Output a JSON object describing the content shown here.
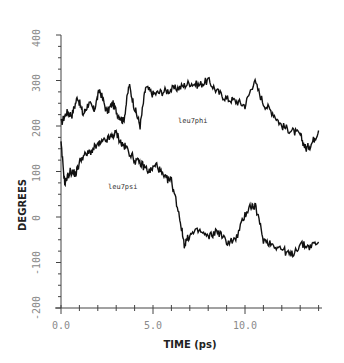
{
  "chart_data": {
    "type": "line",
    "title": "",
    "xlabel": "TIME (ps)",
    "ylabel": "DEGREES",
    "xlim": [
      0,
      14
    ],
    "ylim": [
      -200,
      400
    ],
    "grid": false,
    "legend": "inline labels",
    "x_ticks": [
      "0.0",
      "5.0",
      "10.0"
    ],
    "y_ticks": [
      "-200",
      "-100",
      "0",
      "100",
      "200",
      "300",
      "400"
    ],
    "series": [
      {
        "name": "leu7phi",
        "label": "leu7phi",
        "x": [
          0,
          0.3,
          0.6,
          0.9,
          1.2,
          1.5,
          1.8,
          2.1,
          2.5,
          2.8,
          3.1,
          3.4,
          3.7,
          4.0,
          4.3,
          4.6,
          5.0,
          5.5,
          6.0,
          6.5,
          7.0,
          7.5,
          8.0,
          8.5,
          9.0,
          9.5,
          10.0,
          10.5,
          11.0,
          11.5,
          12.0,
          12.5,
          13.0,
          13.3,
          13.6,
          14.0
        ],
        "values": [
          205,
          230,
          225,
          265,
          225,
          250,
          235,
          280,
          230,
          250,
          225,
          210,
          290,
          240,
          200,
          285,
          270,
          275,
          280,
          285,
          295,
          290,
          300,
          275,
          260,
          255,
          245,
          300,
          250,
          230,
          200,
          190,
          180,
          150,
          160,
          190
        ]
      },
      {
        "name": "leu7psi",
        "label": "leu7psi",
        "x": [
          0,
          0.2,
          0.5,
          0.8,
          1.1,
          1.5,
          1.9,
          2.3,
          2.7,
          3.0,
          3.3,
          3.6,
          4.0,
          4.4,
          4.8,
          5.2,
          5.6,
          6.0,
          6.4,
          6.7,
          7.0,
          7.5,
          8.0,
          8.5,
          9.0,
          9.5,
          10.0,
          10.3,
          10.6,
          11.0,
          11.5,
          12.0,
          12.5,
          13.0,
          13.5,
          14.0
        ],
        "values": [
          160,
          75,
          100,
          95,
          130,
          140,
          155,
          165,
          175,
          185,
          160,
          150,
          125,
          115,
          100,
          115,
          85,
          80,
          10,
          -60,
          -40,
          -30,
          -45,
          -30,
          -55,
          -50,
          5,
          25,
          20,
          -50,
          -60,
          -70,
          -85,
          -60,
          -65,
          -55
        ]
      }
    ]
  },
  "labels": {
    "xlabel": "TIME (ps)",
    "ylabel": "DEGREES",
    "series_phi": "leu7phi",
    "series_psi": "leu7psi",
    "y_ticks": [
      "400",
      "300",
      "200",
      "100",
      "0",
      "-100",
      "-200"
    ],
    "x_ticks": [
      "0.0",
      "5.0",
      "10.0"
    ]
  }
}
